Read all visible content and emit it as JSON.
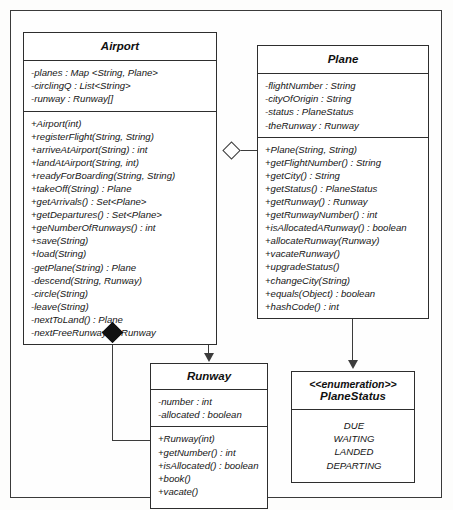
{
  "diagram": {
    "type": "uml-class-diagram"
  },
  "classes": {
    "airport": {
      "name": "Airport",
      "attributes": [
        "-planes : Map <String, Plane>",
        "-circlingQ : List<String>",
        "-runway : Runway[]"
      ],
      "operations": [
        "+Airport(int)",
        "+registerFlight(String, String)",
        "+arriveAtAirport(String) : int",
        "+landAtAirport(String, int)",
        "+readyForBoarding(String, String)",
        "+takeOff(String) : Plane",
        "+getArrivals() : Set<Plane>",
        "+getDepartures() : Set<Plane>",
        "+geNumberOfRunways() : int",
        "+save(String)",
        "+load(String)",
        "-getPlane(String) : Plane",
        "-descend(String, Runway)",
        "-circle(String)",
        "-leave(String)",
        "-nextToLand() : Plane",
        "-nextFreeRunway() : Runway"
      ]
    },
    "plane": {
      "name": "Plane",
      "attributes": [
        "-flightNumber : String",
        "-cityOfOrigin : String",
        "-status : PlaneStatus",
        "-theRunway : Runway"
      ],
      "operations": [
        "+Plane(String, String)",
        "+getFlightNumber() : String",
        "+getCity() : String",
        "+getStatus() : PlaneStatus",
        "+getRunway() : Runway",
        "+getRunwayNumber() : int",
        "+isAllocatedARunway() : boolean",
        "+allocateRunway(Runway)",
        "+vacateRunway()",
        "+upgradeStatus()",
        "+changeCity(String)",
        "+equals(Object) : boolean",
        "+hashCode() : int"
      ]
    },
    "runway": {
      "name": "Runway",
      "attributes": [
        "-number : int",
        "-allocated : boolean"
      ],
      "operations": [
        "+Runway(int)",
        "+getNumber() : int",
        "+isAllocated() : boolean",
        "+book()",
        "+vacate()"
      ]
    },
    "planestatus": {
      "stereotype": "<<enumeration>>",
      "name": "PlaneStatus",
      "literals": [
        "DUE",
        "WAITING",
        "LANDED",
        "DEPARTING"
      ]
    }
  },
  "relationships": [
    {
      "name": "airport-aggregates-plane",
      "from": "Airport",
      "to": "Plane",
      "type": "aggregation",
      "marker": "hollow-diamond"
    },
    {
      "name": "airport-composes-runway",
      "from": "Airport",
      "to": "Runway",
      "type": "composition",
      "marker": "filled-diamond"
    },
    {
      "name": "airport-association-runway",
      "from": "Airport",
      "to": "Runway",
      "type": "directed-association",
      "marker": "open-arrow"
    },
    {
      "name": "plane-association-planestatus",
      "from": "Plane",
      "to": "PlaneStatus",
      "type": "directed-association",
      "marker": "open-arrow"
    }
  ],
  "colors": {
    "line": "#3c3c3c",
    "box_border": "#2e2e2e",
    "background": "#fefefe",
    "filled_diamond": "#111111"
  }
}
